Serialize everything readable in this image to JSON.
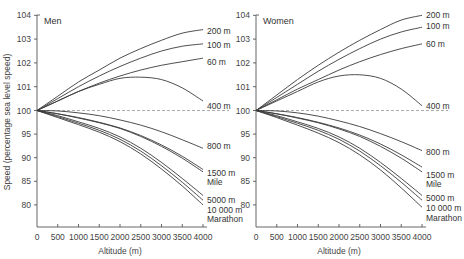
{
  "chart_data": [
    {
      "type": "line",
      "title": "Men",
      "xlabel": "Altitude (m)",
      "ylabel": "Speed (percentage sea level speed)",
      "x": [
        0,
        500,
        1000,
        1500,
        2000,
        2500,
        3000,
        3500,
        4000
      ],
      "x_ticks": [
        "0",
        "500",
        "1000",
        "1500",
        "2000",
        "2500",
        "3000",
        "3500",
        "4000"
      ],
      "y_ticks": [
        "80",
        "85",
        "90",
        "95",
        "100",
        "101",
        "102",
        "103",
        "104"
      ],
      "xlim": [
        0,
        4000
      ],
      "ylim": [
        75,
        104
      ],
      "grid": false,
      "reference_line": {
        "y": 100,
        "style": "dashed"
      },
      "series": [
        {
          "name": "200 m",
          "values": [
            100,
            100.6,
            101.2,
            101.7,
            102.2,
            102.6,
            102.95,
            103.25,
            103.4
          ]
        },
        {
          "name": "100 m",
          "values": [
            100,
            100.5,
            101.0,
            101.45,
            101.85,
            102.2,
            102.5,
            102.7,
            102.8
          ]
        },
        {
          "name": "60 m",
          "values": [
            100,
            100.4,
            100.8,
            101.15,
            101.45,
            101.7,
            101.9,
            102.05,
            102.2
          ]
        },
        {
          "name": "400 m",
          "values": [
            100,
            100.4,
            100.8,
            101.1,
            101.35,
            101.4,
            101.3,
            100.95,
            100.4
          ]
        },
        {
          "name": "800 m",
          "values": [
            100,
            99.9,
            99.5,
            98.9,
            98.0,
            96.9,
            95.5,
            93.8,
            92.0
          ]
        },
        {
          "name": "1500 m",
          "values": [
            100,
            99.3,
            98.5,
            97.5,
            96.3,
            94.7,
            92.7,
            90.3,
            87.5
          ]
        },
        {
          "name": "Mile",
          "values": [
            100,
            99.3,
            98.4,
            97.4,
            96.2,
            94.5,
            92.4,
            89.9,
            87.0
          ]
        },
        {
          "name": "5000 m",
          "values": [
            100,
            98.9,
            97.6,
            96.2,
            94.4,
            92.0,
            89.0,
            85.6,
            82.0
          ]
        },
        {
          "name": "10 000 m",
          "values": [
            100,
            98.7,
            97.3,
            95.8,
            93.9,
            91.4,
            88.3,
            84.8,
            81.0
          ]
        },
        {
          "name": "Marathon",
          "values": [
            100,
            98.5,
            97.0,
            95.4,
            93.4,
            90.8,
            87.6,
            84.0,
            80.0
          ]
        }
      ]
    },
    {
      "type": "line",
      "title": "Women",
      "xlabel": "Altitude (m)",
      "ylabel": "",
      "x": [
        0,
        500,
        1000,
        1500,
        2000,
        2500,
        3000,
        3500,
        4000
      ],
      "x_ticks": [
        "0",
        "500",
        "1000",
        "1500",
        "2000",
        "2500",
        "3000",
        "3500",
        "4000"
      ],
      "y_ticks": [
        "80",
        "85",
        "90",
        "95",
        "100",
        "101",
        "102",
        "103",
        "104"
      ],
      "xlim": [
        0,
        4000
      ],
      "ylim": [
        75,
        104
      ],
      "grid": false,
      "reference_line": {
        "y": 100,
        "style": "dashed"
      },
      "series": [
        {
          "name": "200 m",
          "values": [
            100,
            100.65,
            101.3,
            101.9,
            102.45,
            102.95,
            103.4,
            103.8,
            104.0
          ]
        },
        {
          "name": "100 m",
          "values": [
            100,
            100.55,
            101.1,
            101.65,
            102.15,
            102.6,
            103.0,
            103.3,
            103.5
          ]
        },
        {
          "name": "60 m",
          "values": [
            100,
            100.45,
            100.9,
            101.3,
            101.7,
            102.05,
            102.35,
            102.6,
            102.8
          ]
        },
        {
          "name": "400 m",
          "values": [
            100,
            100.4,
            100.8,
            101.2,
            101.45,
            101.5,
            101.35,
            100.9,
            100.2
          ]
        },
        {
          "name": "800 m",
          "values": [
            100,
            99.9,
            99.5,
            98.8,
            97.8,
            96.6,
            95.1,
            93.4,
            91.5
          ]
        },
        {
          "name": "1500 m",
          "values": [
            100,
            99.3,
            98.5,
            97.5,
            96.3,
            94.8,
            92.9,
            90.6,
            88.0
          ]
        },
        {
          "name": "Mile",
          "values": [
            100,
            99.3,
            98.4,
            97.4,
            96.1,
            94.5,
            92.4,
            89.9,
            87.0
          ]
        },
        {
          "name": "5000 m",
          "values": [
            100,
            98.9,
            97.6,
            96.2,
            94.4,
            92.0,
            89.0,
            85.6,
            82.0
          ]
        },
        {
          "name": "10 000 m",
          "values": [
            100,
            98.7,
            97.3,
            95.8,
            93.9,
            91.4,
            88.3,
            84.8,
            81.0
          ]
        },
        {
          "name": "Marathon",
          "values": [
            100,
            98.5,
            96.9,
            95.2,
            93.2,
            90.6,
            87.4,
            83.6,
            79.5
          ]
        }
      ]
    }
  ],
  "panels": [
    {
      "title": "Men",
      "xlabel": "Altitude (m)"
    },
    {
      "title": "Women",
      "xlabel": "Altitude (m)"
    }
  ],
  "ylabel": "Speed (percentage sea level speed)",
  "series_labels": [
    "200 m",
    "100 m",
    "60 m",
    "400 m",
    "800 m",
    "1500 m",
    "Mile",
    "5000 m",
    "10 000 m",
    "Marathon"
  ],
  "colors": {
    "line": "#3a3a3a",
    "axis": "#555555",
    "reference": "#888888",
    "text": "#333333"
  }
}
